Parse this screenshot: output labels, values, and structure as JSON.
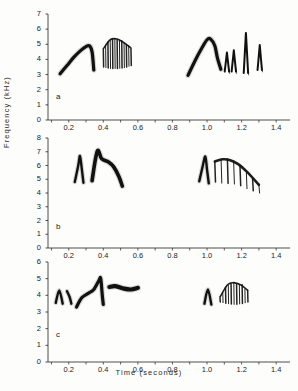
{
  "figure": {
    "x_axis_label": "Time (seconds)",
    "y_axis_label": "Frequency (kHz)",
    "x_ticks": [
      "0.2",
      "0.4",
      "0.6",
      "0.8",
      "1.0",
      "1.2",
      "1.4"
    ],
    "x_tick_values": [
      0.2,
      0.4,
      0.6,
      0.8,
      1.0,
      1.2,
      1.4
    ],
    "xlim": [
      0.08,
      1.48
    ],
    "ink_color": "#111111",
    "axis_color": "#3a3a3a",
    "background_color": "#fdfdfc"
  },
  "panels": [
    {
      "id": "a",
      "label": "a",
      "y_ticks": [
        "0",
        "1",
        "2",
        "3",
        "4",
        "5",
        "6",
        "7"
      ],
      "y_tick_values": [
        0,
        1,
        2,
        3,
        4,
        5,
        6,
        7
      ],
      "ylim": [
        0,
        7
      ]
    },
    {
      "id": "b",
      "label": "b",
      "y_ticks": [
        "0",
        "1",
        "2",
        "3",
        "4",
        "5",
        "6",
        "7",
        "8"
      ],
      "y_tick_values": [
        0,
        1,
        2,
        3,
        4,
        5,
        6,
        7,
        8
      ],
      "ylim": [
        0,
        8
      ]
    },
    {
      "id": "c",
      "label": "c",
      "y_ticks": [
        "0",
        "1",
        "2",
        "3",
        "4",
        "5",
        "6"
      ],
      "y_tick_values": [
        0,
        1,
        2,
        3,
        4,
        5,
        6
      ],
      "ylim": [
        0,
        6
      ]
    }
  ],
  "chart_data": {
    "type": "line",
    "title": "",
    "subtitle": "",
    "xlabel": "Time (seconds)",
    "ylabel": "Frequency (kHz)",
    "xlim": [
      0.08,
      1.48
    ],
    "grid": false,
    "legend": "none",
    "panels": [
      {
        "id": "a",
        "label": "a",
        "ylim": [
          0,
          7
        ],
        "yticks": [
          0,
          1,
          2,
          3,
          4,
          5,
          6,
          7
        ],
        "xticks": [
          0.2,
          0.4,
          0.6,
          0.8,
          1.0,
          1.2,
          1.4
        ],
        "elements": [
          {
            "name": "arch-1",
            "kind": "smooth-arch",
            "t_start": 0.15,
            "t_end": 0.345,
            "f_min": 3.0,
            "f_max": 4.95,
            "trace": [
              [
                0.15,
                3.05
              ],
              [
                0.19,
                3.6
              ],
              [
                0.23,
                4.15
              ],
              [
                0.27,
                4.6
              ],
              [
                0.3,
                4.85
              ],
              [
                0.32,
                4.9
              ],
              [
                0.335,
                4.5
              ],
              [
                0.345,
                3.3
              ]
            ]
          },
          {
            "name": "buzz-1",
            "kind": "striated-buzz",
            "t_start": 0.4,
            "t_end": 0.56,
            "f_min": 3.35,
            "f_max": 5.4,
            "bars": 13,
            "envelope_top": [
              [
                0.4,
                4.7
              ],
              [
                0.44,
                5.3
              ],
              [
                0.48,
                5.35
              ],
              [
                0.52,
                5.1
              ],
              [
                0.56,
                4.75
              ]
            ],
            "envelope_bottom": [
              [
                0.4,
                3.5
              ],
              [
                0.44,
                3.4
              ],
              [
                0.48,
                3.4
              ],
              [
                0.52,
                3.45
              ],
              [
                0.56,
                3.6
              ]
            ]
          },
          {
            "name": "arch-2",
            "kind": "smooth-arch",
            "t_start": 0.89,
            "t_end": 1.08,
            "f_min": 2.95,
            "f_max": 5.35,
            "trace": [
              [
                0.89,
                2.95
              ],
              [
                0.93,
                3.9
              ],
              [
                0.97,
                4.75
              ],
              [
                1.0,
                5.3
              ],
              [
                1.02,
                5.35
              ],
              [
                1.045,
                4.9
              ],
              [
                1.06,
                4.1
              ],
              [
                1.08,
                3.35
              ]
            ]
          },
          {
            "name": "spike-group",
            "kind": "sharp-peaks",
            "t_start": 1.09,
            "t_end": 1.34,
            "f_min": 3.1,
            "f_max": 5.75,
            "peaks": [
              {
                "t": 1.115,
                "f_peak": 4.45,
                "f_base": 3.2
              },
              {
                "t": 1.155,
                "f_peak": 4.6,
                "f_base": 3.2
              },
              {
                "t": 1.225,
                "f_peak": 5.75,
                "f_base": 3.1
              },
              {
                "t": 1.305,
                "f_peak": 4.95,
                "f_base": 3.3
              }
            ]
          }
        ]
      },
      {
        "id": "b",
        "label": "b",
        "ylim": [
          0,
          8
        ],
        "yticks": [
          0,
          1,
          2,
          3,
          4,
          5,
          6,
          7,
          8
        ],
        "xticks": [
          0.2,
          0.4,
          0.6,
          0.8,
          1.0,
          1.2,
          1.4
        ],
        "elements": [
          {
            "name": "hook-1",
            "kind": "sharp-peak",
            "t_start": 0.235,
            "t_end": 0.285,
            "f_min": 4.75,
            "f_max": 6.7,
            "trace": [
              [
                0.235,
                4.8
              ],
              [
                0.255,
                6.0
              ],
              [
                0.265,
                6.7
              ],
              [
                0.275,
                5.8
              ],
              [
                0.285,
                4.75
              ]
            ]
          },
          {
            "name": "hook-2-with-tail",
            "kind": "peak-and-plateau",
            "t_start": 0.335,
            "t_end": 0.51,
            "f_min": 4.5,
            "f_max": 7.1,
            "trace": [
              [
                0.335,
                4.9
              ],
              [
                0.355,
                6.5
              ],
              [
                0.37,
                7.1
              ],
              [
                0.39,
                6.5
              ],
              [
                0.43,
                6.25
              ],
              [
                0.46,
                5.9
              ],
              [
                0.49,
                5.2
              ],
              [
                0.51,
                4.5
              ]
            ]
          },
          {
            "name": "hook-3",
            "kind": "sharp-peak",
            "t_start": 0.955,
            "t_end": 1.01,
            "f_min": 4.7,
            "f_max": 6.65,
            "trace": [
              [
                0.955,
                4.85
              ],
              [
                0.975,
                5.95
              ],
              [
                0.99,
                6.65
              ],
              [
                1.0,
                5.7
              ],
              [
                1.01,
                4.7
              ]
            ]
          },
          {
            "name": "buzz-descending",
            "kind": "striated-descending",
            "t_start": 1.045,
            "t_end": 1.3,
            "f_min": 4.0,
            "f_max": 6.45,
            "bars": 8,
            "envelope_top": [
              [
                1.045,
                6.3
              ],
              [
                1.09,
                6.45
              ],
              [
                1.13,
                6.4
              ],
              [
                1.18,
                6.1
              ],
              [
                1.23,
                5.55
              ],
              [
                1.3,
                4.6
              ]
            ],
            "envelope_bottom": [
              [
                1.045,
                4.8
              ],
              [
                1.09,
                4.7
              ],
              [
                1.13,
                4.7
              ],
              [
                1.18,
                4.6
              ],
              [
                1.23,
                4.3
              ],
              [
                1.3,
                4.0
              ]
            ]
          }
        ]
      },
      {
        "id": "c",
        "label": "c",
        "ylim": [
          0,
          6
        ],
        "yticks": [
          0,
          1,
          2,
          3,
          4,
          5,
          6
        ],
        "xticks": [
          0.2,
          0.4,
          0.6,
          0.8,
          1.0,
          1.2,
          1.4
        ],
        "elements": [
          {
            "name": "tick-1",
            "kind": "sharp-peak",
            "t_start": 0.125,
            "t_end": 0.165,
            "f_min": 3.5,
            "f_max": 4.3,
            "trace": [
              [
                0.125,
                3.55
              ],
              [
                0.145,
                4.3
              ],
              [
                0.165,
                3.5
              ]
            ]
          },
          {
            "name": "tick-2",
            "kind": "sharp-peak",
            "t_start": 0.19,
            "t_end": 0.215,
            "f_min": 3.5,
            "f_max": 4.25,
            "trace": [
              [
                0.19,
                4.25
              ],
              [
                0.205,
                3.9
              ],
              [
                0.215,
                3.5
              ]
            ]
          },
          {
            "name": "rising-sweep",
            "kind": "smooth-rise",
            "t_start": 0.245,
            "t_end": 0.4,
            "f_min": 3.25,
            "f_max": 5.0,
            "trace": [
              [
                0.245,
                3.3
              ],
              [
                0.275,
                3.85
              ],
              [
                0.31,
                4.1
              ],
              [
                0.345,
                4.35
              ],
              [
                0.375,
                4.9
              ],
              [
                0.385,
                5.0
              ],
              [
                0.395,
                3.9
              ],
              [
                0.4,
                3.45
              ]
            ]
          },
          {
            "name": "flat-bar",
            "kind": "plateau",
            "t_start": 0.435,
            "t_end": 0.6,
            "f_min": 4.2,
            "f_max": 4.6,
            "trace": [
              [
                0.435,
                4.5
              ],
              [
                0.47,
                4.55
              ],
              [
                0.52,
                4.4
              ],
              [
                0.56,
                4.35
              ],
              [
                0.6,
                4.45
              ]
            ]
          },
          {
            "name": "tick-3",
            "kind": "sharp-peak",
            "t_start": 0.985,
            "t_end": 1.025,
            "f_min": 3.45,
            "f_max": 4.35,
            "trace": [
              [
                0.985,
                3.5
              ],
              [
                1.005,
                4.35
              ],
              [
                1.025,
                3.45
              ]
            ]
          },
          {
            "name": "buzz-2",
            "kind": "striated-buzz",
            "t_start": 1.075,
            "t_end": 1.235,
            "f_min": 3.45,
            "f_max": 4.75,
            "bars": 11,
            "envelope_top": [
              [
                1.075,
                3.9
              ],
              [
                1.12,
                4.65
              ],
              [
                1.16,
                4.75
              ],
              [
                1.2,
                4.6
              ],
              [
                1.235,
                4.3
              ]
            ],
            "envelope_bottom": [
              [
                1.075,
                3.6
              ],
              [
                1.12,
                3.5
              ],
              [
                1.16,
                3.45
              ],
              [
                1.2,
                3.5
              ],
              [
                1.235,
                3.6
              ]
            ]
          }
        ]
      }
    ]
  }
}
